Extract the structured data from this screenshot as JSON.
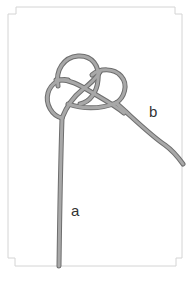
{
  "diagram": {
    "type": "knot-illustration",
    "labels": {
      "end_a": "a",
      "end_b": "b"
    },
    "colors": {
      "background": "#ffffff",
      "frame": "#d0d0d0",
      "rope": "#8f8f8f",
      "rope_edge": "#6e6e6e",
      "label": "#333333"
    }
  }
}
